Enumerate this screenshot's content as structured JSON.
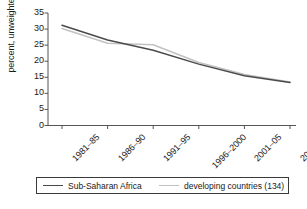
{
  "chart_data": {
    "type": "line",
    "title": "",
    "subtitle": "",
    "xlabel": "",
    "ylabel": "percent, unweighted",
    "categories": [
      "1981–85",
      "1986–90",
      "1991–95",
      "1996–2000",
      "2001–05",
      "2006–08"
    ],
    "ylim": [
      0,
      35
    ],
    "yticks": [
      0,
      5,
      10,
      15,
      20,
      25,
      30,
      35
    ],
    "ytick_labels": [
      "0",
      "5",
      "10",
      "15",
      "20",
      "25",
      "30",
      "35"
    ],
    "grid": false,
    "legend_position": "bottom",
    "series": [
      {
        "name": "Sub-Saharan Africa",
        "color": "#4a4a4a",
        "values": [
          31.2,
          26.6,
          23.4,
          19.1,
          15.5,
          13.4
        ]
      },
      {
        "name": "developing countries (134)",
        "color": "#c2c2c2",
        "values": [
          30.2,
          25.6,
          25.1,
          19.6,
          15.9,
          13.5
        ]
      }
    ]
  },
  "axis": {
    "line_color": "#555555",
    "ylabel_text": "percent, unweighted"
  },
  "legend": {
    "entries": [
      {
        "label": "Sub-Saharan Africa",
        "color": "#4a4a4a"
      },
      {
        "label": "developing countries (134)",
        "color": "#c2c2c2"
      }
    ]
  }
}
